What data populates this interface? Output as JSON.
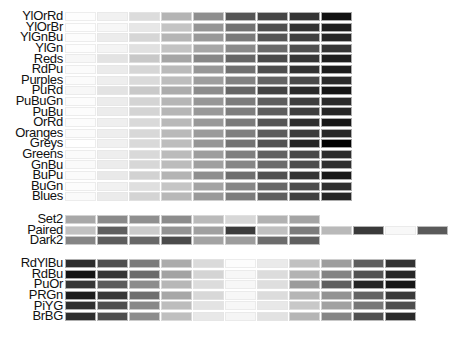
{
  "chart_data": {
    "type": "heatmap",
    "title": "",
    "groups": [
      {
        "name": "sequential",
        "n_colors": 9,
        "palettes": [
          {
            "name": "YlOrRd",
            "grays": [
              "#fdfdfd",
              "#f1f1f1",
              "#dcdcdc",
              "#b4b4b4",
              "#8e8e8e",
              "#555555",
              "#454545",
              "#343434",
              "#111111"
            ]
          },
          {
            "name": "YlOrBr",
            "grays": [
              "#fefefe",
              "#f7f7f7",
              "#e7e7e7",
              "#c4c4c4",
              "#959595",
              "#727272",
              "#4f4f4f",
              "#343434",
              "#1e1e1e"
            ]
          },
          {
            "name": "YlGnBu",
            "grays": [
              "#fcfcfc",
              "#ececec",
              "#d6d6d6",
              "#b5b5b5",
              "#999999",
              "#7a7a7a",
              "#555555",
              "#404040",
              "#262626"
            ]
          },
          {
            "name": "YlGn",
            "grays": [
              "#fdfdfd",
              "#f4f4f4",
              "#e1e1e1",
              "#c3c3c3",
              "#a6a6a6",
              "#8a8a8a",
              "#6a6a6a",
              "#505050",
              "#353535"
            ]
          },
          {
            "name": "Reds",
            "grays": [
              "#f7f7f7",
              "#e3e3e3",
              "#c8c8c8",
              "#a5a5a5",
              "#878787",
              "#666666",
              "#4a4a4a",
              "#363636",
              "#1e1e1e"
            ]
          },
          {
            "name": "RdPu",
            "grays": [
              "#fbfbfb",
              "#ebebeb",
              "#d6d6d6",
              "#bababa",
              "#979797",
              "#707070",
              "#4e4e4e",
              "#333333",
              "#1c1c1c"
            ]
          },
          {
            "name": "Purples",
            "grays": [
              "#fbfbfb",
              "#eeeeee",
              "#dadada",
              "#bdbdbd",
              "#9e9e9e",
              "#828282",
              "#646464",
              "#4a4a4a",
              "#2b2b2b"
            ]
          },
          {
            "name": "PuRd",
            "grays": [
              "#f7f7f7",
              "#e3e3e3",
              "#c9c9c9",
              "#acacac",
              "#8c8c8c",
              "#666666",
              "#434343",
              "#2a2a2a",
              "#151515"
            ]
          },
          {
            "name": "PuBuGn",
            "grays": [
              "#fcfcfc",
              "#ececec",
              "#d4d4d4",
              "#b6b6b6",
              "#979797",
              "#7c7c7c",
              "#5e5e5e",
              "#3f3f3f",
              "#2a2a2a"
            ]
          },
          {
            "name": "PuBu",
            "grays": [
              "#fcfcfc",
              "#ececec",
              "#d4d4d4",
              "#b6b6b6",
              "#999999",
              "#7e7e7e",
              "#5e5e5e",
              "#3f3f3f",
              "#262626"
            ]
          },
          {
            "name": "OrRd",
            "grays": [
              "#fcfcfc",
              "#efefef",
              "#d9d9d9",
              "#b9b9b9",
              "#999999",
              "#7b7b7b",
              "#555555",
              "#2f2f2f",
              "#161616"
            ]
          },
          {
            "name": "Oranges",
            "grays": [
              "#fbfbfb",
              "#eeeeee",
              "#d8d8d8",
              "#b9b9b9",
              "#9b9b9b",
              "#7f7f7f",
              "#5c5c5c",
              "#3c3c3c",
              "#272727"
            ]
          },
          {
            "name": "Greys",
            "grays": [
              "#ffffff",
              "#f0f0f0",
              "#d9d9d9",
              "#bdbdbd",
              "#969696",
              "#737373",
              "#525252",
              "#252525",
              "#000000"
            ]
          },
          {
            "name": "Greens",
            "grays": [
              "#fbfbfb",
              "#eeeeee",
              "#d9d9d9",
              "#bbbbbb",
              "#9d9d9d",
              "#7f7f7f",
              "#626262",
              "#484848",
              "#2c2c2c"
            ]
          },
          {
            "name": "GnBu",
            "grays": [
              "#fafafa",
              "#ececec",
              "#d7d7d7",
              "#bcbcbc",
              "#a0a0a0",
              "#868686",
              "#6b6b6b",
              "#4d4d4d",
              "#2e2e2e"
            ]
          },
          {
            "name": "BuPu",
            "grays": [
              "#fbfbfb",
              "#e9e9e9",
              "#d2d2d2",
              "#b4b4b4",
              "#8f8f8f",
              "#6e6e6e",
              "#515151",
              "#343434",
              "#181818"
            ]
          },
          {
            "name": "BuGn",
            "grays": [
              "#fcfcfc",
              "#f1f1f1",
              "#dfdfdf",
              "#c5c5c5",
              "#a3a3a3",
              "#868686",
              "#676767",
              "#4c4c4c",
              "#2f2f2f"
            ]
          },
          {
            "name": "Blues",
            "grays": [
              "#fafafa",
              "#ebebeb",
              "#d4d4d4",
              "#b8b8b8",
              "#999999",
              "#7c7c7c",
              "#5f5f5f",
              "#414141",
              "#262626"
            ]
          }
        ]
      },
      {
        "name": "qualitative",
        "palettes": [
          {
            "name": "Set2",
            "n_colors": 8,
            "grays": [
              "#a8a8a8",
              "#8a8a8a",
              "#8f8f8f",
              "#8c8c8c",
              "#bababa",
              "#d7d7d7",
              "#b2b2b2",
              "#a4a4a4"
            ]
          },
          {
            "name": "Paired",
            "n_colors": 12,
            "grays": [
              "#c1c1c1",
              "#5f5f5f",
              "#cbcbcb",
              "#939393",
              "#a0a0a0",
              "#3c3c3c",
              "#c0c0c0",
              "#7c7c7c",
              "#b9b9b9",
              "#3a3a3a",
              "#f8f8f8",
              "#5a5a5a"
            ]
          },
          {
            "name": "Dark2",
            "n_colors": 8,
            "grays": [
              "#858585",
              "#5d5d5d",
              "#686868",
              "#4b4b4b",
              "#a3a3a3",
              "#9c9c9c",
              "#6c6c6c",
              "#606060"
            ]
          }
        ]
      },
      {
        "name": "diverging",
        "n_colors": 11,
        "palettes": [
          {
            "name": "RdYlBu",
            "grays": [
              "#2d2d2d",
              "#4f4f4f",
              "#7b7b7b",
              "#ababab",
              "#dadada",
              "#fcfcfc",
              "#eaeaea",
              "#c1c1c1",
              "#9d9d9d",
              "#5f5f5f",
              "#333333"
            ]
          },
          {
            "name": "RdBu",
            "grays": [
              "#141414",
              "#363636",
              "#6b6b6b",
              "#a3a3a3",
              "#d4d4d4",
              "#f7f7f7",
              "#dcdcdc",
              "#b3b3b3",
              "#838383",
              "#535353",
              "#272727"
            ]
          },
          {
            "name": "PuOr",
            "grays": [
              "#353535",
              "#5b5b5b",
              "#8c8c8c",
              "#b7b7b7",
              "#dcdcdc",
              "#f7f7f7",
              "#dedede",
              "#9c9c9c",
              "#5f5f5f",
              "#262626",
              "#161616"
            ]
          },
          {
            "name": "PRGn",
            "grays": [
              "#1c1c1c",
              "#383838",
              "#6f6f6f",
              "#a7a7a7",
              "#d8d8d8",
              "#f7f7f7",
              "#dcdcdc",
              "#b6b6b6",
              "#939393",
              "#646464",
              "#3a3a3a"
            ]
          },
          {
            "name": "PiYG",
            "grays": [
              "#2f2f2f",
              "#4f4f4f",
              "#888888",
              "#bdbdbd",
              "#e3e3e3",
              "#f7f7f7",
              "#e8e8e8",
              "#c8c8c8",
              "#a1a1a1",
              "#777777",
              "#4e4e4e"
            ]
          },
          {
            "name": "BrBG",
            "grays": [
              "#2e2e2e",
              "#4e4e4e",
              "#8c8c8c",
              "#bfbfbf",
              "#e8e8e8",
              "#f5f5f5",
              "#e2e2e2",
              "#b5b5b5",
              "#858585",
              "#505050",
              "#2a2a2a"
            ]
          }
        ]
      }
    ],
    "layout": {
      "legend": "row labels at left",
      "grid": false
    }
  },
  "labels": {
    "sequential": [
      "YlOrRd",
      "YlOrBr",
      "YlGnBu",
      "YlGn",
      "Reds",
      "RdPu",
      "Purples",
      "PuRd",
      "PuBuGn",
      "PuBu",
      "OrRd",
      "Oranges",
      "Greys",
      "Greens",
      "GnBu",
      "BuPu",
      "BuGn",
      "Blues"
    ],
    "qualitative": [
      "Set2",
      "Paired",
      "Dark2"
    ],
    "diverging": [
      "RdYlBu",
      "RdBu",
      "PuOr",
      "PRGn",
      "PiYG",
      "BrBG"
    ]
  }
}
